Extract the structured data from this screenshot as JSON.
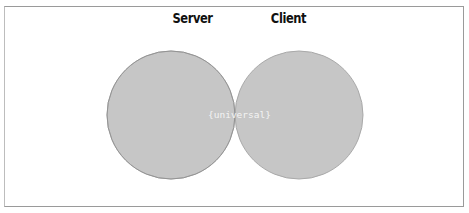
{
  "diagram": {
    "type": "venn",
    "sets": [
      {
        "name": "Server",
        "fill": "#c6c6c6",
        "stroke": "#a8a8a8"
      },
      {
        "name": "Client",
        "fill": "#c6c6c6",
        "stroke": "#a8a8a8"
      }
    ],
    "intersection": {
      "label": "{universal}",
      "fill": "#9e9e9e"
    }
  }
}
